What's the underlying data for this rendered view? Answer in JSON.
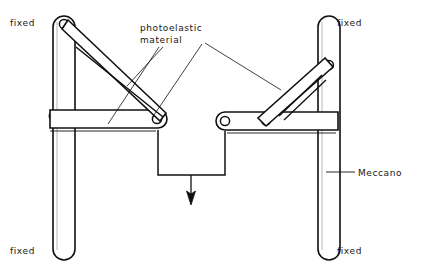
{
  "figure": {
    "background_color": "#ffffff",
    "line_color": "#101010",
    "width": 426,
    "height": 278
  },
  "labels": {
    "fixed_top_left": "fixed",
    "fixed_bottom_left": "fixed",
    "fixed_top_right": "fixed",
    "fixed_bottom_right": "fixed",
    "meccano": "Meccano",
    "photoelastic_line1": "photoelastic",
    "photoelastic_line2": "material"
  },
  "components": {
    "left_column": "vertical-meccano-strip-left",
    "right_column": "vertical-meccano-strip-right",
    "left_horizontal_strip": "horizontal-strip-left",
    "right_horizontal_strip": "horizontal-strip-right",
    "left_diagonal_strip": "diagonal-strip-left",
    "right_diagonal_strip": "diagonal-strip-right",
    "left_inner_diagonal": "inner-diagonal-left",
    "right_inner_diagonal": "inner-diagonal-right",
    "hanger": "u-shaped-load-hanger",
    "load_arrow": "downward-load-arrow"
  },
  "pivots": {
    "count": 8,
    "description": "riveted pivot holes at strip ends and mid-span"
  }
}
